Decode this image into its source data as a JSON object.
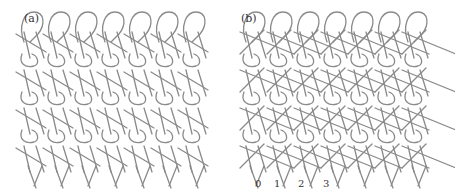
{
  "figure": {
    "panels": [
      {
        "id": "a",
        "label": "(a)",
        "wales": 7,
        "courses": 4,
        "x": 22,
        "label_x": 24,
        "label_y": 14
      },
      {
        "id": "b",
        "label": "(b)",
        "wales": 7,
        "courses": 4,
        "x": 240,
        "label_x": 241,
        "label_y": 14
      }
    ],
    "needle_labels": [
      "0",
      "1",
      "2",
      "3"
    ],
    "line_color": "#8a8a8a",
    "background": "#ffffff"
  }
}
